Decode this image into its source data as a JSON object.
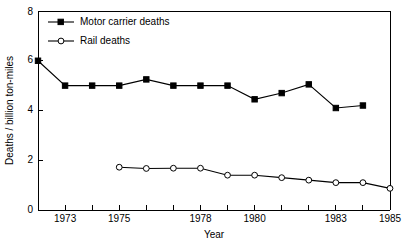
{
  "chart_data": {
    "type": "line",
    "title": "",
    "xlabel": "Year",
    "ylabel": "Deaths / billion ton-miles",
    "xlim": [
      1972,
      1985
    ],
    "ylim": [
      0,
      8
    ],
    "grid": false,
    "legend_position": "top-left",
    "y_ticks": [
      0,
      2,
      4,
      6,
      8
    ],
    "y_tick_labels": [
      "0",
      "2",
      "4",
      "6",
      "8"
    ],
    "x_ticks": [
      1973,
      1974,
      1975,
      1976,
      1977,
      1978,
      1979,
      1980,
      1981,
      1982,
      1983,
      1984,
      1985
    ],
    "x_tick_labels_shown": [
      "1973",
      "1975",
      "1978",
      "1980",
      "1983",
      "1985"
    ],
    "x_labeled_ticks": [
      {
        "year": 1973,
        "label": "1973"
      },
      {
        "year": 1975,
        "label": "1975"
      },
      {
        "year": 1978,
        "label": "1978"
      },
      {
        "year": 1980,
        "label": "1980"
      },
      {
        "year": 1983,
        "label": "1983"
      },
      {
        "year": 1985,
        "label": "1985"
      }
    ],
    "series": [
      {
        "name": "Motor carrier deaths",
        "marker": "filled-square",
        "x": [
          1972,
          1973,
          1974,
          1975,
          1976,
          1977,
          1978,
          1979,
          1980,
          1981,
          1982,
          1983,
          1984
        ],
        "values": [
          6.0,
          5.0,
          5.0,
          5.0,
          5.25,
          5.0,
          5.0,
          5.0,
          4.45,
          4.7,
          5.05,
          4.1,
          4.2
        ]
      },
      {
        "name": "Rail deaths",
        "marker": "open-circle",
        "x": [
          1975,
          1976,
          1977,
          1978,
          1979,
          1980,
          1981,
          1982,
          1983,
          1984,
          1985
        ],
        "values": [
          1.72,
          1.67,
          1.68,
          1.68,
          1.4,
          1.4,
          1.3,
          1.2,
          1.1,
          1.1,
          0.87
        ]
      }
    ]
  },
  "legend": {
    "items": [
      {
        "label": "Motor carrier deaths",
        "marker": "filled-square"
      },
      {
        "label": "Rail deaths",
        "marker": "open-circle"
      }
    ]
  },
  "axes": {
    "y_title": "Deaths / billion ton-miles",
    "x_title": "Year"
  }
}
